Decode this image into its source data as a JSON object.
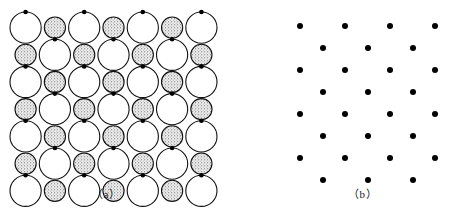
{
  "figure": {
    "title": "",
    "background_color": "#ffffff",
    "width": 454,
    "height": 211
  },
  "panels": [
    {
      "id": "a",
      "caption": "（a）",
      "caption_x": 105,
      "caption_y": 192,
      "description": "close-packed two-dimensional crystal structure of large open ions and small stippled ions with lattice points marked by black dots",
      "origin_x": 10,
      "origin_y": 12,
      "ion_large": {
        "name": "large-ion",
        "radius": 15.6,
        "fill_color": "#ffffff",
        "stroke_color": "#111111",
        "stroke_width": 1.1
      },
      "ion_small": {
        "name": "small-ion",
        "radius": 10.6,
        "fill_color": "#e2e2e2",
        "stroke_color": "#111111",
        "stroke_width": 1.1,
        "texture": "stipple"
      },
      "lattice_point": {
        "name": "lattice-point",
        "radius": 2.3,
        "fill_color": "#000000"
      },
      "columns": 7,
      "rows": 7,
      "spacing_x": 29.3,
      "spacing_y": 27.2
    },
    {
      "id": "b",
      "caption": "（b）",
      "caption_x": 360,
      "caption_y": 192,
      "description": "centered rectangular Bravais lattice of points corresponding to panel a",
      "lattice_point": {
        "name": "lattice-point",
        "radius": 3.0,
        "fill_color": "#000000"
      },
      "corner_xs": [
        73,
        118,
        163,
        208
      ],
      "center_xs": [
        96,
        141,
        186
      ],
      "corner_ys": [
        26,
        70,
        114,
        158
      ],
      "center_ys": [
        48,
        92,
        136,
        180
      ],
      "offset_x": 227
    }
  ],
  "colors": {
    "ink": "#111111",
    "dot": "#000000",
    "large_ion_fill": "#ffffff",
    "small_ion_fill": "#e2e2e2",
    "background": "#ffffff"
  }
}
